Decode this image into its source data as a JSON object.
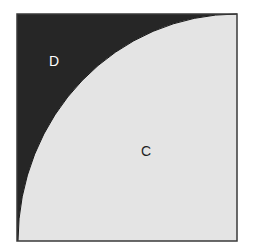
{
  "diagram": {
    "square": {
      "x": 17,
      "y": 14,
      "width": 220,
      "height": 227
    },
    "colors": {
      "dark_region": "#262626",
      "light_region": "#e4e4e4",
      "border": "#3a3a3a",
      "background": "#ffffff",
      "label_on_dark": "#ffffff",
      "label_on_light": "#222222"
    },
    "regions": [
      {
        "id": "D",
        "label": "D",
        "shade": "dark",
        "position": "upper-left, above curve"
      },
      {
        "id": "C",
        "label": "C",
        "shade": "light",
        "position": "lower-right, below curve"
      }
    ],
    "labels": {
      "D": {
        "text": "D",
        "x": 54,
        "y": 66
      },
      "C": {
        "text": "C",
        "x": 146,
        "y": 156
      }
    },
    "curve": {
      "type": "elliptical-arc",
      "from": [
        18,
        241
      ],
      "to": [
        237,
        14
      ],
      "rx": 219,
      "ry": 227,
      "center": [
        237,
        241
      ]
    }
  }
}
